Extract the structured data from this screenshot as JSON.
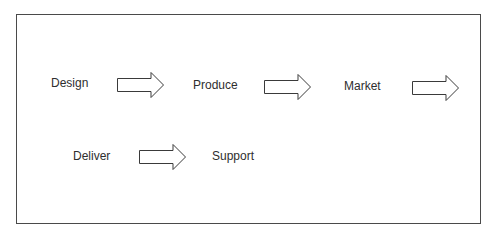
{
  "diagram": {
    "type": "process-flow",
    "border_color": "#4a4a4a",
    "steps": [
      {
        "label": "Design"
      },
      {
        "label": "Produce"
      },
      {
        "label": "Market"
      },
      {
        "label": "Deliver"
      },
      {
        "label": "Support"
      }
    ],
    "arrows": [
      {
        "from": "Design",
        "to": "Produce",
        "icon": "block-arrow-right-icon"
      },
      {
        "from": "Produce",
        "to": "Market",
        "icon": "block-arrow-right-icon"
      },
      {
        "from": "Market",
        "to": "Deliver",
        "icon": "block-arrow-right-icon"
      },
      {
        "from": "Deliver",
        "to": "Support",
        "icon": "block-arrow-right-icon"
      }
    ]
  }
}
